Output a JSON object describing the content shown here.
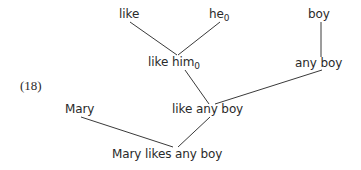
{
  "example_number": "(18)",
  "nodes": {
    "like": {
      "text": "like",
      "sub": ""
    },
    "he": {
      "text": "he",
      "sub": "0"
    },
    "boy": {
      "text": "boy",
      "sub": ""
    },
    "like_him": {
      "text": "like him",
      "sub": "0"
    },
    "any_boy": {
      "text": "any boy",
      "sub": ""
    },
    "mary": {
      "text": "Mary",
      "sub": ""
    },
    "like_any_boy": {
      "text": "like any boy",
      "sub": ""
    },
    "mary_likes_any_boy": {
      "text": "Mary likes any boy",
      "sub": ""
    }
  },
  "edges": [
    {
      "from": "like",
      "to": "like_him"
    },
    {
      "from": "he",
      "to": "like_him"
    },
    {
      "from": "boy",
      "to": "any_boy"
    },
    {
      "from": "like_him",
      "to": "like_any_boy"
    },
    {
      "from": "any_boy",
      "to": "like_any_boy"
    },
    {
      "from": "mary",
      "to": "mary_likes_any_boy"
    },
    {
      "from": "like_any_boy",
      "to": "mary_likes_any_boy"
    }
  ]
}
